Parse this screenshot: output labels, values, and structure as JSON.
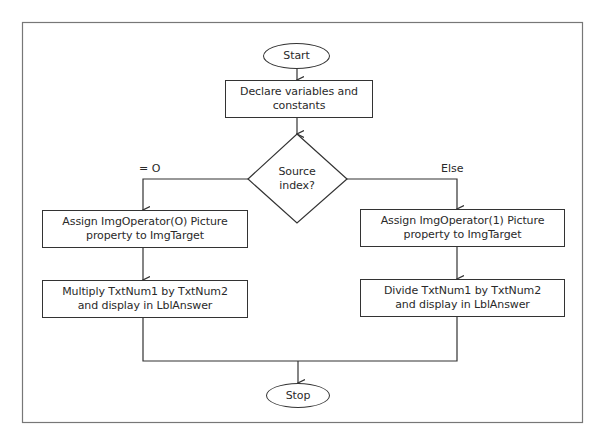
{
  "diagram": {
    "type": "flowchart",
    "nodes": {
      "start": {
        "shape": "oval",
        "label": "Start"
      },
      "declare": {
        "shape": "process",
        "label": "Declare variables and constants"
      },
      "decision": {
        "shape": "decision",
        "label": "Source index?"
      },
      "assign0": {
        "shape": "process",
        "label": "Assign ImgOperator(O) Picture property to ImgTarget"
      },
      "multiply": {
        "shape": "process",
        "label": "Multiply TxtNum1 by TxtNum2 and display in LblAnswer"
      },
      "assign1": {
        "shape": "process",
        "label": "Assign ImgOperator(1) Picture property to ImgTarget"
      },
      "divide": {
        "shape": "process",
        "label": "Divide TxtNum1 by TxtNum2 and display in LblAnswer"
      },
      "stop": {
        "shape": "oval",
        "label": "Stop"
      }
    },
    "edge_labels": {
      "left": "= O",
      "right": "Else"
    },
    "edges": [
      {
        "from": "start",
        "to": "declare"
      },
      {
        "from": "declare",
        "to": "decision"
      },
      {
        "from": "decision",
        "to": "assign0",
        "label": "= O"
      },
      {
        "from": "decision",
        "to": "assign1",
        "label": "Else"
      },
      {
        "from": "assign0",
        "to": "multiply"
      },
      {
        "from": "assign1",
        "to": "divide"
      },
      {
        "from": "multiply",
        "to": "stop"
      },
      {
        "from": "divide",
        "to": "stop"
      }
    ],
    "colors": {
      "stroke": "#333333",
      "text": "#2a2a2a",
      "frame": "#666666",
      "background": "#ffffff"
    }
  }
}
